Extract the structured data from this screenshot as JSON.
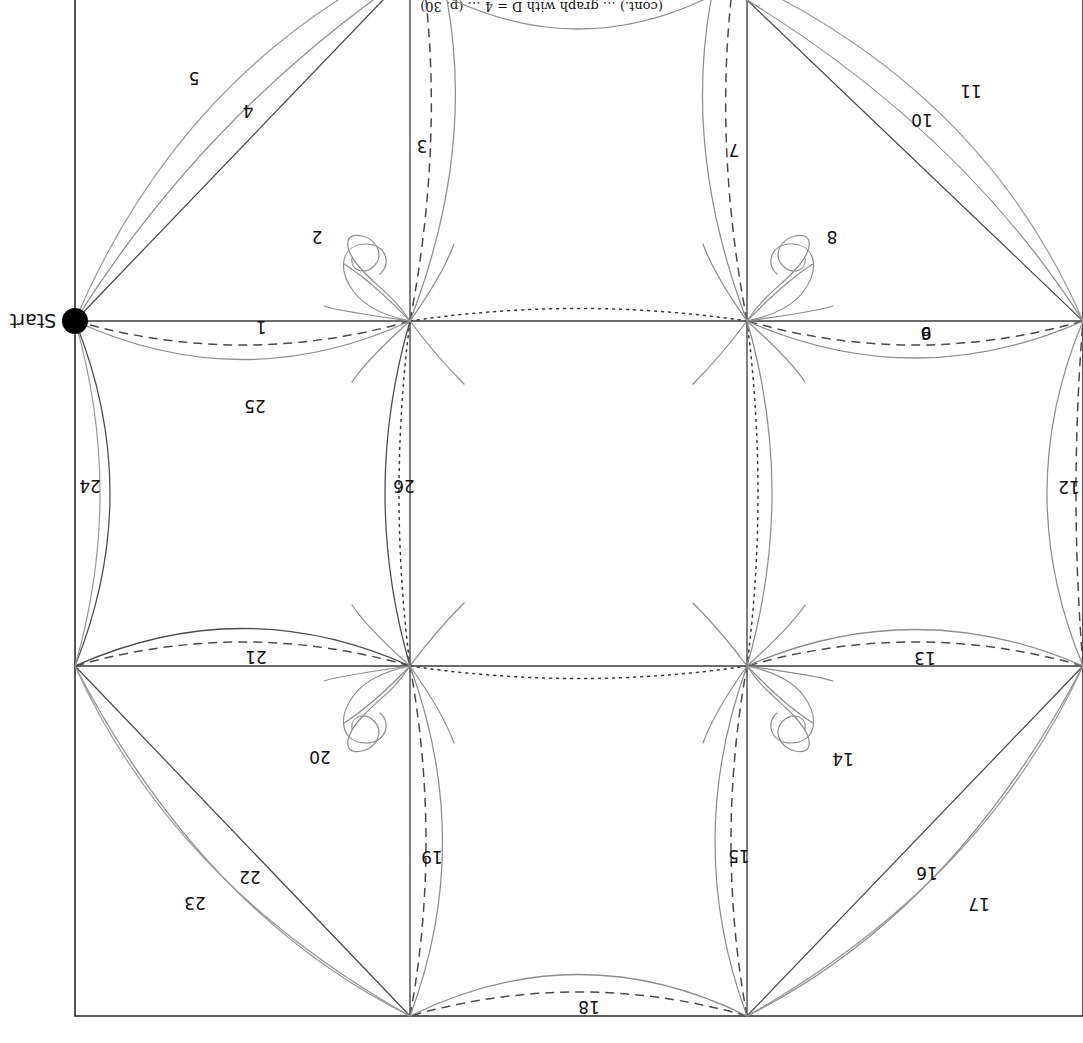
{
  "figure": {
    "type": "eulerian-path-lattice-diagram",
    "orientation_degrees": 180,
    "start_label": "Start",
    "caption_partial": "(cont.) … graph with D = 4 … (p. 30)",
    "colors": {
      "frame": "#2b2b2b",
      "grid": "#3a3a3a",
      "edge_dark": "#4a4a4a",
      "edge_gray": "#8e8e8e",
      "dashed": "#4a4a4a",
      "dotted": "#3a3a3a",
      "start_vertex": "#000000",
      "background": "#ffffff",
      "label_text": "#111111"
    },
    "edge_count": 26,
    "edge_labels": [
      {
        "id": 1,
        "text": "1",
        "x": 822,
        "y": 722,
        "style": "dashed"
      },
      {
        "id": 2,
        "text": "2",
        "x": 766,
        "y": 812,
        "style": "spiral-loop"
      },
      {
        "id": 3,
        "text": "3",
        "x": 661,
        "y": 903,
        "style": "dashed"
      },
      {
        "id": 4,
        "text": "4",
        "x": 835,
        "y": 938,
        "style": "solid-gray"
      },
      {
        "id": 5,
        "text": "5",
        "x": 889,
        "y": 971,
        "style": "solid-gray"
      },
      {
        "id": 6,
        "text": "6",
        "x": 157,
        "y": 716,
        "style": "dashed"
      },
      {
        "id": 7,
        "text": "7",
        "x": 349,
        "y": 899,
        "style": "dashed"
      },
      {
        "id": 8,
        "text": "8",
        "x": 251,
        "y": 812,
        "style": "spiral-loop"
      },
      {
        "id": 9,
        "text": "9",
        "x": 0,
        "y": 0,
        "style": "hidden"
      },
      {
        "id": 10,
        "text": "10",
        "x": 161,
        "y": 929,
        "style": "solid-gray"
      },
      {
        "id": 11,
        "text": "11",
        "x": 112,
        "y": 958,
        "style": "solid-gray"
      },
      {
        "id": 12,
        "text": "12",
        "x": 8,
        "y": 556,
        "style": "dashed"
      },
      {
        "id": 13,
        "text": "13",
        "x": 158,
        "y": 391,
        "style": "dashed"
      },
      {
        "id": 14,
        "text": "14",
        "x": 240,
        "y": 290,
        "style": "spiral-loop"
      },
      {
        "id": 15,
        "text": "15",
        "x": 344,
        "y": 193,
        "style": "dashed"
      },
      {
        "id": 16,
        "text": "16",
        "x": 156,
        "y": 176,
        "style": "solid-gray"
      },
      {
        "id": 17,
        "text": "17",
        "x": 104,
        "y": 145,
        "style": "solid-gray"
      },
      {
        "id": 18,
        "text": "18",
        "x": 494,
        "y": 36,
        "style": "dashed"
      },
      {
        "id": 19,
        "text": "19",
        "x": 651,
        "y": 192,
        "style": "dashed"
      },
      {
        "id": 20,
        "text": "20",
        "x": 763,
        "y": 292,
        "style": "spiral-loop"
      },
      {
        "id": 21,
        "text": "21",
        "x": 827,
        "y": 392,
        "style": "dashed"
      },
      {
        "id": 22,
        "text": "22",
        "x": 833,
        "y": 172,
        "style": "solid-gray"
      },
      {
        "id": 23,
        "text": "23",
        "x": 888,
        "y": 146,
        "style": "solid-gray"
      },
      {
        "id": 24,
        "text": "24",
        "x": 993,
        "y": 557,
        "style": "solid-gray"
      },
      {
        "id": 25,
        "text": "25",
        "x": 828,
        "y": 643,
        "style": "solid-gray"
      },
      {
        "id": 26,
        "text": "26",
        "x": 679,
        "y": 557,
        "style": "dotted"
      }
    ],
    "vertices": [
      {
        "name": "start",
        "x": 1008,
        "y": 722,
        "filled": true
      },
      {
        "name": "v-mid-left",
        "x": 336,
        "y": 722,
        "filled": false
      },
      {
        "name": "v-mid-right",
        "x": 673,
        "y": 722,
        "filled": false
      },
      {
        "name": "v-up-left",
        "x": 336,
        "y": 377,
        "filled": false
      },
      {
        "name": "v-up-right",
        "x": 673,
        "y": 377,
        "filled": false
      },
      {
        "name": "corner-tl",
        "x": 336,
        "y": 27,
        "filled": false
      },
      {
        "name": "corner-tr",
        "x": 673,
        "y": 27,
        "filled": false
      },
      {
        "name": "edge-l-up",
        "x": 0,
        "y": 377,
        "filled": false
      },
      {
        "name": "edge-l-mid",
        "x": 0,
        "y": 722,
        "filled": false
      },
      {
        "name": "edge-r-up",
        "x": 1008,
        "y": 377,
        "filled": false
      }
    ]
  }
}
